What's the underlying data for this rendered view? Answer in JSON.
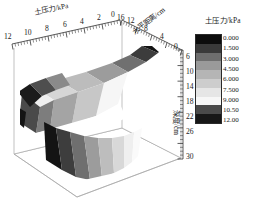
{
  "figure": {
    "type": "3d-surface-contour-plot",
    "background": "#ffffff",
    "frame_color": "#9a9a9a",
    "text_color": "#1a1a1a"
  },
  "legend": {
    "title": "土压力/kPa",
    "labels": [
      "0.000",
      "1.500",
      "3.000",
      "4.500",
      "6.000",
      "7.500",
      "9.000",
      "10.50",
      "12.00"
    ],
    "colors": [
      "#0d0d0d",
      "#3a3a3a",
      "#6e6e6e",
      "#9a9a9a",
      "#b5b5b5",
      "#cdcdcd",
      "#e6e6e6",
      "#f7f7f7",
      "#4a4a4a",
      "#171717"
    ]
  },
  "axes": {
    "left": {
      "label": "土压力/kPa",
      "ticks": [
        "12",
        "10",
        "8",
        "6",
        "4",
        "2",
        "0"
      ]
    },
    "top_right": {
      "label": "水平距离/cm",
      "ticks": [
        "16",
        "12",
        "8",
        "4",
        "0"
      ]
    },
    "right": {
      "label": "深度/cm",
      "ticks": [
        "6",
        "10",
        "14",
        "18",
        "22",
        "26",
        "30"
      ]
    }
  },
  "chart_data": {
    "type": "heatmap",
    "title": "",
    "subtitle": "",
    "xlabel": "水平距离/cm",
    "ylabel": "深度/cm",
    "zlabel": "土压力/kPa",
    "legend_position": "right",
    "grid": false,
    "colorbar": {
      "name": "土压力/kPa",
      "unit": "kPa",
      "levels": [
        0.0,
        1.5,
        3.0,
        4.5,
        6.0,
        7.5,
        9.0,
        10.5,
        12.0
      ],
      "min": 0.0,
      "max": 12.0,
      "scheme": "grayscale"
    },
    "axis_ranges": {
      "soil_pressure_kPa": [
        0,
        12
      ],
      "horizontal_distance_cm": [
        0,
        16
      ],
      "depth_cm": [
        2,
        30
      ]
    },
    "axis_tick_labels": {
      "soil_pressure_kPa": [
        12,
        10,
        8,
        6,
        4,
        2,
        0
      ],
      "horizontal_distance_cm": [
        16,
        12,
        8,
        4,
        0
      ],
      "depth_cm": [
        6,
        10,
        14,
        18,
        22,
        26,
        30
      ]
    },
    "series": [
      {
        "name": "土压力等值面 (upper lobe)",
        "depth_cm_range": [
          2,
          16
        ],
        "peak_value_kPa": 12.0,
        "peak_location": {
          "horizontal_distance_cm": 2,
          "depth_cm": 4
        }
      },
      {
        "name": "土压力等值面 (lower lobe)",
        "depth_cm_range": [
          16,
          30
        ],
        "peak_value_kPa": 12.0,
        "peak_location": {
          "horizontal_distance_cm": 14,
          "depth_cm": 24
        }
      }
    ],
    "contour_bands_kPa": [
      {
        "from": 0.0,
        "to": 1.5,
        "color": "#0d0d0d"
      },
      {
        "from": 1.5,
        "to": 3.0,
        "color": "#3a3a3a"
      },
      {
        "from": 3.0,
        "to": 4.5,
        "color": "#6e6e6e"
      },
      {
        "from": 4.5,
        "to": 6.0,
        "color": "#9a9a9a"
      },
      {
        "from": 6.0,
        "to": 7.5,
        "color": "#b5b5b5"
      },
      {
        "from": 7.5,
        "to": 9.0,
        "color": "#cdcdcd"
      },
      {
        "from": 9.0,
        "to": 10.5,
        "color": "#e6e6e6"
      },
      {
        "from": 10.5,
        "to": 12.0,
        "color": "#4a4a4a"
      }
    ]
  }
}
